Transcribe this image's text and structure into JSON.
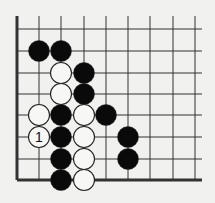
{
  "diagram": {
    "type": "go-board-corner",
    "colors": {
      "background": "#f1f1ef",
      "line": "#333333",
      "black": "#0a0a0a",
      "white": "#f7f7f5",
      "stone_outline": "#222222"
    },
    "grid": {
      "columns_x": [
        17,
        39,
        61,
        84,
        106,
        128,
        150,
        173,
        195
      ],
      "rows_y": [
        29,
        51,
        73,
        94,
        115,
        137,
        159,
        180
      ],
      "top_y": 16,
      "right_x": 202,
      "left_edge_thick": true,
      "bottom_edge_thick": true
    },
    "stones": [
      {
        "color": "black",
        "col": 1,
        "row": 1,
        "label": ""
      },
      {
        "color": "black",
        "col": 2,
        "row": 1,
        "label": ""
      },
      {
        "color": "white",
        "col": 2,
        "row": 2,
        "label": ""
      },
      {
        "color": "black",
        "col": 3,
        "row": 2,
        "label": ""
      },
      {
        "color": "white",
        "col": 2,
        "row": 3,
        "label": ""
      },
      {
        "color": "black",
        "col": 3,
        "row": 3,
        "label": ""
      },
      {
        "color": "white",
        "col": 1,
        "row": 4,
        "label": ""
      },
      {
        "color": "black",
        "col": 2,
        "row": 4,
        "label": ""
      },
      {
        "color": "white",
        "col": 3,
        "row": 4,
        "label": ""
      },
      {
        "color": "black",
        "col": 4,
        "row": 4,
        "label": ""
      },
      {
        "color": "white",
        "col": 1,
        "row": 5,
        "label": "1"
      },
      {
        "color": "black",
        "col": 2,
        "row": 5,
        "label": ""
      },
      {
        "color": "white",
        "col": 3,
        "row": 5,
        "label": ""
      },
      {
        "color": "black",
        "col": 5,
        "row": 5,
        "label": ""
      },
      {
        "color": "black",
        "col": 2,
        "row": 6,
        "label": ""
      },
      {
        "color": "white",
        "col": 3,
        "row": 6,
        "label": ""
      },
      {
        "color": "black",
        "col": 5,
        "row": 6,
        "label": ""
      },
      {
        "color": "black",
        "col": 2,
        "row": 7,
        "label": ""
      },
      {
        "color": "white",
        "col": 3,
        "row": 7,
        "label": ""
      }
    ]
  }
}
